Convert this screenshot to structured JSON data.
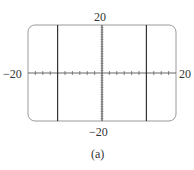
{
  "chart_data": {
    "type": "line",
    "title": "",
    "caption": "(a)",
    "xlabel": "",
    "ylabel": "",
    "xlim": [
      -20,
      20
    ],
    "ylim": [
      -20,
      20
    ],
    "x_tick_spacing": 2,
    "y_tick_spacing": 1,
    "grid": false,
    "tick_labels": {
      "x_min": "−20",
      "x_max": "20",
      "y_min": "−20",
      "y_max": "20"
    },
    "series": [
      {
        "name": "vertical-line-left",
        "x": [
          -12,
          -12
        ],
        "y": [
          -20,
          20
        ]
      },
      {
        "name": "vertical-line-right",
        "x": [
          12,
          12
        ],
        "y": [
          -20,
          20
        ]
      }
    ]
  },
  "labels": {
    "x_min": "−20",
    "x_max": "20",
    "y_max": "20",
    "y_min": "−20",
    "caption": "(a)"
  }
}
